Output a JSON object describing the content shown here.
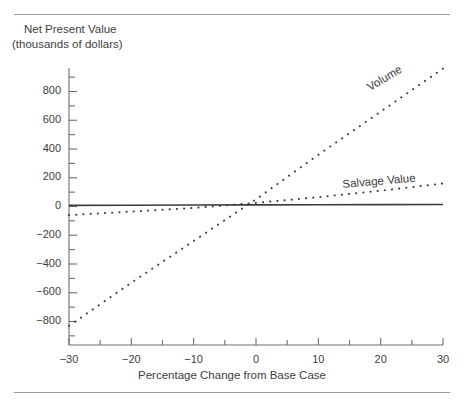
{
  "figure": {
    "rules": {
      "top": true,
      "bottom": true
    }
  },
  "chart_data": {
    "type": "line",
    "title": "",
    "ylabel_line1": "Net Present Value",
    "ylabel_line2": "(thousands of dollars)",
    "xlabel": "Percentage Change from Base Case",
    "grid": false,
    "legend_position": "inline-end-of-line",
    "xlim": [
      -32,
      30
    ],
    "ylim": [
      -960,
      970
    ],
    "xticks": [
      -30,
      -20,
      -10,
      0,
      10,
      20,
      30
    ],
    "xtick_labels": [
      "-30",
      "-20",
      "-10",
      "0",
      "10",
      "20",
      "30"
    ],
    "xminor_ticks": [
      -25,
      -15,
      -5,
      5,
      15,
      25
    ],
    "yticks": [
      800,
      600,
      400,
      200,
      0,
      -200,
      -400,
      -600,
      -800
    ],
    "ytick_labels": [
      "800",
      "600",
      "400",
      "200",
      "0",
      "-200",
      "-400",
      "-600",
      "-800"
    ],
    "yminor_ticks": [
      900,
      700,
      500,
      300,
      100,
      -100,
      -300,
      -500,
      -700,
      -900
    ],
    "x": [
      -30,
      -20,
      -10,
      0,
      10,
      20,
      30
    ],
    "series": [
      {
        "name": "Volume",
        "style": "dashed",
        "values": [
          -830,
          -530,
          -240,
          50,
          360,
          660,
          960
        ],
        "label": "Volume"
      },
      {
        "name": "Salvage Value",
        "style": "dashed",
        "values": [
          -60,
          -35,
          -10,
          25,
          65,
          110,
          160
        ],
        "label": "Salvage Value"
      },
      {
        "name": "Base",
        "style": "solid",
        "values": [
          8,
          9,
          10,
          11,
          12,
          13,
          14
        ],
        "label": ""
      }
    ],
    "colors": {
      "line": "#3d3d3d",
      "axis": "#6e6e6e",
      "text": "#3d3d3d",
      "rule": "#9b9b9b",
      "background": "#ffffff"
    }
  }
}
